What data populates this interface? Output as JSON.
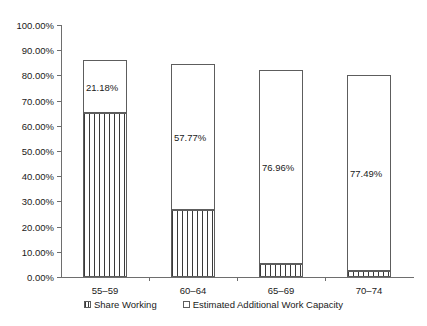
{
  "chart_data": {
    "type": "bar",
    "title": "",
    "subtitle": "",
    "xlabel": "",
    "ylabel": "",
    "stacked": true,
    "grid": false,
    "legend_position": "bottom",
    "ylim": [
      0,
      1.0
    ],
    "categories": [
      "55–59",
      "60–64",
      "65–69",
      "70–74"
    ],
    "ytick_labels": [
      "0.00%",
      "10.00%",
      "20.00%",
      "30.00%",
      "40.00%",
      "50.00%",
      "60.00%",
      "70.00%",
      "80.00%",
      "90.00%",
      "100.00%"
    ],
    "ytick_values": [
      0,
      10,
      20,
      30,
      40,
      50,
      60,
      70,
      80,
      90,
      100
    ],
    "series": [
      {
        "name": "Share Working",
        "fill": "vertical-hatch",
        "values": [
          65.0,
          26.6,
          5.0,
          2.5
        ]
      },
      {
        "name": "Estimated Additional Work Capacity",
        "fill": "white",
        "values": [
          21.18,
          57.77,
          76.96,
          77.49
        ]
      }
    ],
    "data_labels": [
      "21.18%",
      "57.77%",
      "76.96%",
      "77.49%"
    ],
    "totals": [
      86.18,
      84.37,
      81.96,
      79.99
    ],
    "colors": {
      "axis": "#6e6e6e",
      "bar_outline": "#5d5d5d",
      "hatch": "#3a3a3a",
      "background": "#ffffff",
      "text": "#1a1a1a"
    }
  },
  "legend": {
    "items": [
      {
        "label": "Share Working",
        "marker": "hatched-square-icon"
      },
      {
        "label": "Estimated Additional Work Capacity",
        "marker": "white-square-icon"
      }
    ]
  }
}
